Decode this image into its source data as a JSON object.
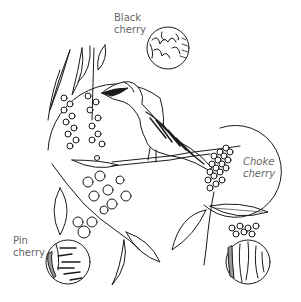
{
  "illustration": {
    "subject": "Cedar waxwing bird perched among cherry branches with bark and fruit detail insets",
    "labels": [
      {
        "id": "black",
        "line1": "Black",
        "line2": "cherry"
      },
      {
        "id": "choke",
        "line1": "Choke",
        "line2": "cherry"
      },
      {
        "id": "pin",
        "line1": "Pin",
        "line2": "cherry"
      }
    ],
    "colors": {
      "ink": "#1a1a1a",
      "label": "#666666",
      "background": "#ffffff"
    }
  }
}
